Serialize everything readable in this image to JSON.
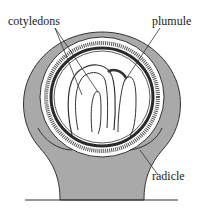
{
  "diagram": {
    "labels": {
      "cotyledons": "cotyledons",
      "plumule": "plumule",
      "radicle": "radicle"
    },
    "colors": {
      "tissue": "#a9a9a9",
      "outline": "#333333",
      "embryo": "#ffffff",
      "dark_layer": "#2a2a2a"
    }
  }
}
